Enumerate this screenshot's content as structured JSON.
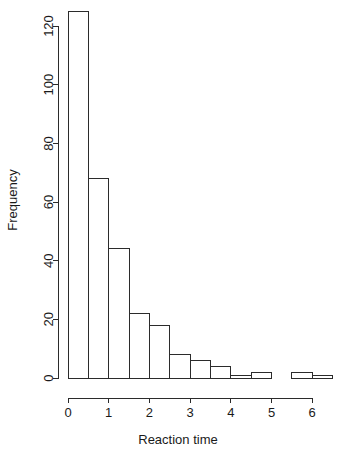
{
  "chart_data": {
    "type": "bar",
    "chart_subtype": "histogram",
    "title": "",
    "xlabel": "Reaction time",
    "ylabel": "Frequency",
    "bin_width": 0.5,
    "bin_edges": [
      0,
      0.5,
      1,
      1.5,
      2,
      2.5,
      3,
      3.5,
      4,
      4.5,
      5,
      5.5,
      6,
      6.5
    ],
    "categories": [
      "0-0.5",
      "0.5-1",
      "1-1.5",
      "1.5-2",
      "2-2.5",
      "2.5-3",
      "3-3.5",
      "3.5-4",
      "4-4.5",
      "4.5-5",
      "5-5.5",
      "5.5-6",
      "6-6.5"
    ],
    "values": [
      125,
      68,
      44,
      22,
      18,
      8,
      6,
      4,
      1,
      2,
      0,
      2,
      1
    ],
    "xlim": [
      0,
      6.5
    ],
    "ylim": [
      0,
      125
    ],
    "xticks": [
      0,
      1,
      2,
      3,
      4,
      5,
      6
    ],
    "xtick_labels": [
      "0",
      "1",
      "2",
      "3",
      "4",
      "5",
      "6"
    ],
    "yticks": [
      0,
      20,
      40,
      60,
      80,
      100,
      120
    ],
    "ytick_labels": [
      "0",
      "20",
      "40",
      "60",
      "80",
      "100",
      "120"
    ],
    "grid": false,
    "legend": null,
    "bar_fill_color": "#ffffff",
    "bar_stroke_color": "#2b2b2b",
    "axis_color": "#2b2b2b",
    "background_color": "#ffffff"
  }
}
